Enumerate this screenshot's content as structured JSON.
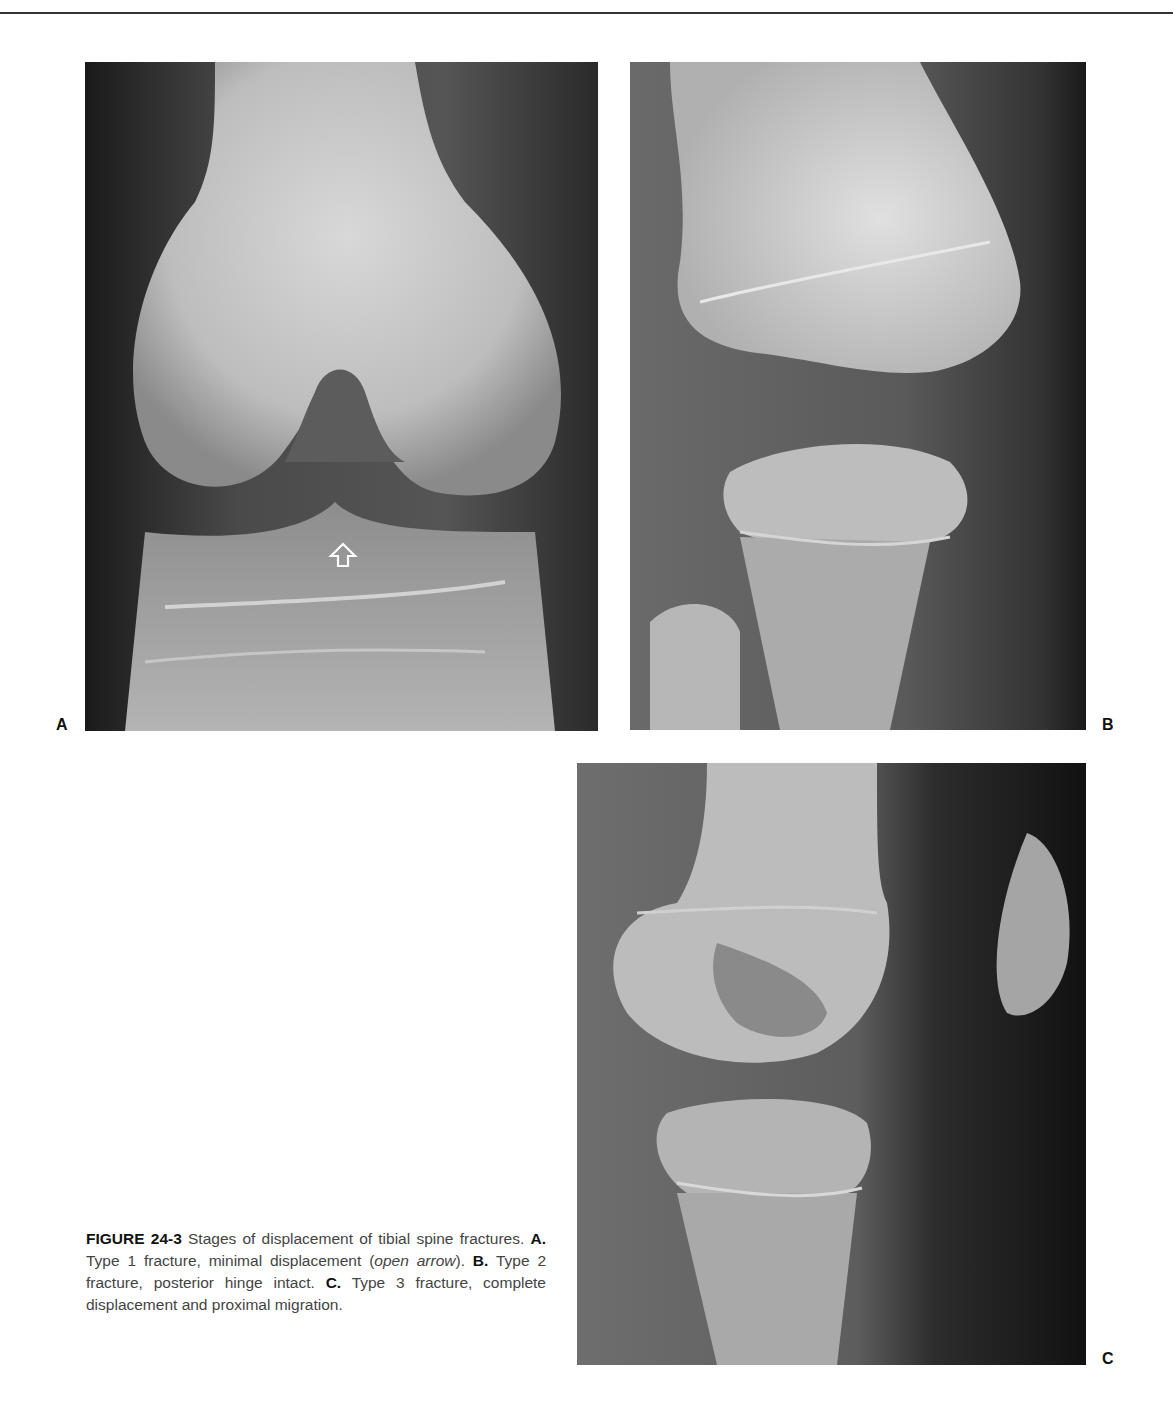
{
  "header": {
    "running_head": "CHAPTER 24 ■ KNEE FRACTURES"
  },
  "figure": {
    "panels": [
      {
        "label": "A",
        "description": "AP radiograph of knee, type 1 tibial spine fracture with open arrow marker"
      },
      {
        "label": "B",
        "description": "Lateral radiograph of knee, type 2 tibial spine fracture"
      },
      {
        "label": "C",
        "description": "Lateral radiograph of knee, type 3 tibial spine fracture"
      }
    ],
    "caption": {
      "number": "FIGURE 24-3",
      "intro": " Stages of displacement of tibial spine fractures. ",
      "a_label": "A.",
      "a_text": " Type 1 fracture, minimal displacement (",
      "a_italic": "open arrow",
      "a_end": "). ",
      "b_label": "B.",
      "b_text": " Type 2 fracture, posterior hinge intact. ",
      "c_label": "C.",
      "c_text": " Type 3 fracture, complete displacement and proximal migration."
    }
  }
}
